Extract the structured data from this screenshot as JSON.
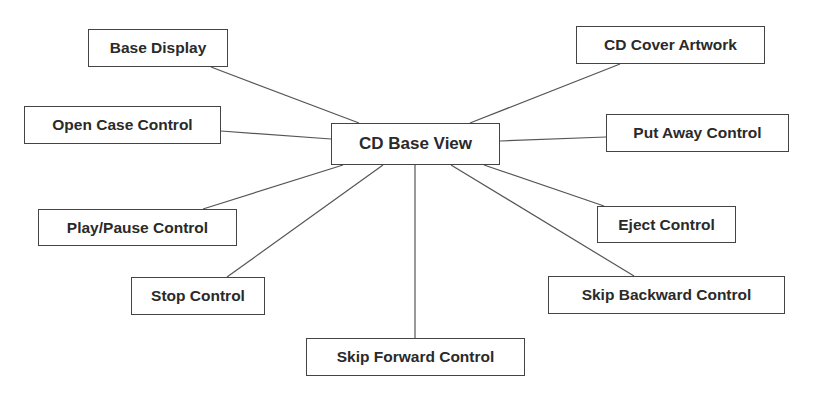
{
  "diagram": {
    "center": {
      "id": "cd-base-view",
      "label": "CD Base View",
      "x": 331,
      "y": 123,
      "w": 169,
      "h": 42
    },
    "nodes": [
      {
        "id": "base-display",
        "label": "Base Display",
        "x": 88,
        "y": 29,
        "w": 140,
        "h": 38,
        "anchor": [
          211,
          67
        ],
        "center_anchor": [
          359,
          123
        ]
      },
      {
        "id": "cd-cover-artwork",
        "label": "CD Cover Artwork",
        "x": 576,
        "y": 26,
        "w": 189,
        "h": 38,
        "anchor": [
          620,
          64
        ],
        "center_anchor": [
          470,
          123
        ]
      },
      {
        "id": "open-case-control",
        "label": "Open Case Control",
        "x": 24,
        "y": 106,
        "w": 197,
        "h": 38,
        "anchor": [
          221,
          131
        ],
        "center_anchor": [
          331,
          139
        ]
      },
      {
        "id": "put-away-control",
        "label": "Put Away Control",
        "x": 606,
        "y": 114,
        "w": 183,
        "h": 38,
        "anchor": [
          606,
          137
        ],
        "center_anchor": [
          500,
          141
        ]
      },
      {
        "id": "play-pause-control",
        "label": "Play/Pause Control",
        "x": 38,
        "y": 209,
        "w": 199,
        "h": 37,
        "anchor": [
          203,
          209
        ],
        "center_anchor": [
          343,
          165
        ]
      },
      {
        "id": "eject-control",
        "label": "Eject Control",
        "x": 597,
        "y": 206,
        "w": 139,
        "h": 37,
        "anchor": [
          604,
          206
        ],
        "center_anchor": [
          484,
          165
        ]
      },
      {
        "id": "stop-control",
        "label": "Stop Control",
        "x": 131,
        "y": 277,
        "w": 134,
        "h": 38,
        "anchor": [
          227,
          277
        ],
        "center_anchor": [
          383,
          165
        ]
      },
      {
        "id": "skip-backward-control",
        "label": "Skip Backward Control",
        "x": 548,
        "y": 276,
        "w": 237,
        "h": 38,
        "anchor": [
          634,
          276
        ],
        "center_anchor": [
          451,
          165
        ]
      },
      {
        "id": "skip-forward-control",
        "label": "Skip Forward Control",
        "x": 306,
        "y": 338,
        "w": 219,
        "h": 38,
        "anchor": [
          415,
          338
        ],
        "center_anchor": [
          415,
          165
        ]
      }
    ],
    "colors": {
      "line": "#555555",
      "border": "#444444",
      "text": "#2a2a2a",
      "background": "#ffffff"
    }
  }
}
